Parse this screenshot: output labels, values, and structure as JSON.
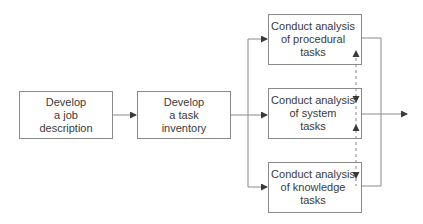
{
  "diagram": {
    "type": "flowchart",
    "nodes": [
      {
        "id": "job-description",
        "lines": [
          "Develop",
          "a job",
          "description"
        ]
      },
      {
        "id": "task-inventory",
        "lines": [
          "Develop",
          "a task",
          "inventory"
        ]
      },
      {
        "id": "procedural",
        "lines": [
          "Conduct analysis",
          "of procedural",
          "tasks"
        ]
      },
      {
        "id": "system",
        "lines": [
          "Conduct analysis",
          "of system",
          "tasks"
        ]
      },
      {
        "id": "knowledge",
        "lines": [
          "Conduct analysis",
          "of knowledge",
          "tasks"
        ]
      }
    ],
    "edges": [
      {
        "from": "job-description",
        "to": "task-inventory",
        "style": "solid"
      },
      {
        "from": "task-inventory",
        "to": "procedural",
        "style": "solid"
      },
      {
        "from": "task-inventory",
        "to": "system",
        "style": "solid"
      },
      {
        "from": "task-inventory",
        "to": "knowledge",
        "style": "solid"
      },
      {
        "from": "procedural",
        "to": "output",
        "style": "solid"
      },
      {
        "from": "system",
        "to": "output",
        "style": "solid"
      },
      {
        "from": "knowledge",
        "to": "output",
        "style": "solid"
      },
      {
        "from": "system",
        "to": "procedural",
        "style": "dashed"
      },
      {
        "from": "procedural",
        "to": "system",
        "style": "dashed"
      },
      {
        "from": "knowledge",
        "to": "system",
        "style": "dashed"
      },
      {
        "from": "system",
        "to": "knowledge",
        "style": "dashed"
      }
    ],
    "colors": {
      "line": "#7a7a7a",
      "text": "#3a3a3a",
      "border": "#8a8a8a"
    }
  }
}
